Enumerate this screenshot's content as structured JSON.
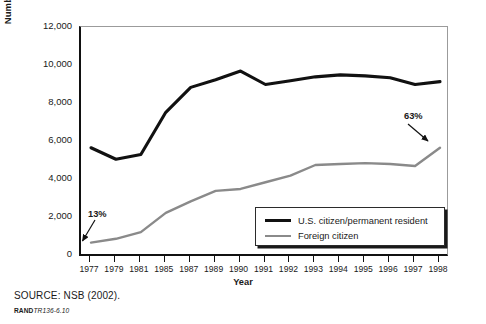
{
  "figure": {
    "source_note": "SOURCE: NSB (2002).",
    "rand_mark": "RAND",
    "rand_code": "TR136-6.10"
  },
  "axes": {
    "y_title": "Number of degrees granted",
    "x_title": "Year",
    "y_ticks": [
      "0",
      "2,000",
      "4,000",
      "6,000",
      "8,000",
      "10,000",
      "12,000"
    ],
    "y_tick_values": [
      0,
      2000,
      4000,
      6000,
      8000,
      10000,
      12000
    ]
  },
  "legend": {
    "items": [
      {
        "label": "U.S. citizen/permanent resident",
        "color": "#111111"
      },
      {
        "label": "Foreign citizen",
        "color": "#8a8a8a"
      }
    ]
  },
  "annotations": [
    {
      "text": "13%",
      "target": "start of foreign citizen series"
    },
    {
      "text": "63%",
      "target": "end of foreign citizen series"
    }
  ],
  "chart_data": {
    "type": "line",
    "title": "",
    "xlabel": "Year",
    "ylabel": "Number of degrees granted",
    "ylim": [
      0,
      12000
    ],
    "grid": false,
    "legend_position": "inside lower right",
    "categories": [
      "1977",
      "1979",
      "1981",
      "1985",
      "1987",
      "1989",
      "1990",
      "1991",
      "1992",
      "1993",
      "1994",
      "1995",
      "1996",
      "1997",
      "1998"
    ],
    "series": [
      {
        "name": "U.S. citizen/permanent resident",
        "color": "#111111",
        "values": [
          5700,
          5100,
          5350,
          7550,
          8850,
          9250,
          9700,
          9000,
          9200,
          9400,
          9500,
          9450,
          9350,
          9000,
          9150
        ]
      },
      {
        "name": "Foreign citizen",
        "color": "#8a8a8a",
        "values": [
          750,
          950,
          1300,
          2300,
          2900,
          3450,
          3550,
          3900,
          4250,
          4800,
          4850,
          4900,
          4850,
          4750,
          5700
        ]
      }
    ],
    "annotations": [
      {
        "text": "13%",
        "x": "1977",
        "y": 750
      },
      {
        "text": "63%",
        "x": "1998",
        "y": 5700
      }
    ]
  }
}
